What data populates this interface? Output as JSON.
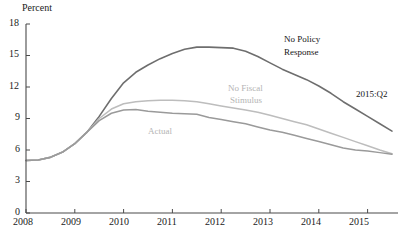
{
  "chart_data": {
    "type": "line",
    "title": "",
    "subtitle": "",
    "xlabel": "",
    "ylabel": "Percent",
    "ylim": [
      0,
      18
    ],
    "xlim": [
      2008,
      2015.5
    ],
    "yticks": [
      "0",
      "3",
      "6",
      "9",
      "12",
      "15",
      "18"
    ],
    "ytick_values": [
      0,
      3,
      6,
      9,
      12,
      15,
      18
    ],
    "xticks": [
      "2008",
      "2009",
      "2010",
      "2011",
      "2012",
      "2013",
      "2014",
      "2015"
    ],
    "xtick_values": [
      2008,
      2009,
      2010,
      2011,
      2012,
      2013,
      2014,
      2015
    ],
    "grid": false,
    "legend_position": "inline-annotations",
    "x": [
      2008.0,
      2008.25,
      2008.5,
      2008.75,
      2009.0,
      2009.25,
      2009.5,
      2009.75,
      2010.0,
      2010.25,
      2010.5,
      2010.75,
      2011.0,
      2011.25,
      2011.5,
      2011.75,
      2012.0,
      2012.25,
      2012.5,
      2012.75,
      2013.0,
      2013.25,
      2013.5,
      2013.75,
      2014.0,
      2014.25,
      2014.5,
      2014.75,
      2015.0,
      2015.25,
      2015.5
    ],
    "series": [
      {
        "name": "No Policy Response",
        "color": "#6e6e6e",
        "values": [
          5.0,
          5.05,
          5.3,
          5.8,
          6.6,
          7.7,
          9.2,
          10.9,
          12.4,
          13.4,
          14.1,
          14.7,
          15.2,
          15.6,
          15.8,
          15.8,
          15.75,
          15.7,
          15.4,
          14.9,
          14.3,
          13.7,
          13.2,
          12.7,
          12.1,
          11.4,
          10.6,
          9.9,
          9.2,
          8.5,
          7.8
        ]
      },
      {
        "name": "No Fiscal Stimulus",
        "color": "#bdbdbd",
        "values": [
          5.0,
          5.05,
          5.3,
          5.8,
          6.6,
          7.7,
          9.0,
          9.9,
          10.4,
          10.6,
          10.7,
          10.75,
          10.75,
          10.7,
          10.6,
          10.4,
          10.2,
          10.0,
          9.8,
          9.6,
          9.3,
          9.0,
          8.7,
          8.4,
          8.0,
          7.6,
          7.2,
          6.8,
          6.4,
          6.0,
          5.65
        ]
      },
      {
        "name": "Actual",
        "color": "#9a9a9a",
        "values": [
          5.0,
          5.05,
          5.3,
          5.8,
          6.6,
          7.7,
          8.8,
          9.5,
          9.8,
          9.85,
          9.7,
          9.6,
          9.5,
          9.45,
          9.4,
          9.1,
          8.9,
          8.7,
          8.5,
          8.2,
          7.9,
          7.7,
          7.4,
          7.1,
          6.8,
          6.5,
          6.2,
          6.0,
          5.9,
          5.75,
          5.6
        ]
      }
    ],
    "annotations": [
      {
        "text": "No Policy Response",
        "x": 2014.0,
        "y": 16.6,
        "color": "#151515"
      },
      {
        "text": "No Fiscal Stimulus",
        "x": 2012.3,
        "y": 11.6,
        "color": "#b0b0b0"
      },
      {
        "text": "Actual",
        "x": 2010.6,
        "y": 7.6,
        "color": "#b0b0b0"
      },
      {
        "text": "2015:Q2",
        "x": 2015.5,
        "y": 10.6,
        "color": "#151515"
      }
    ]
  },
  "labels": {
    "axis_title_y": "Percent",
    "annotation_no_policy_line1": "No Policy",
    "annotation_no_policy_line2": "Response",
    "annotation_no_fiscal_line1": "No Fiscal",
    "annotation_no_fiscal_line2": "Stimulus",
    "annotation_actual": "Actual",
    "annotation_quarter": "2015:Q2",
    "ytick_0": "0",
    "ytick_3": "3",
    "ytick_6": "6",
    "ytick_9": "9",
    "ytick_12": "12",
    "ytick_15": "15",
    "ytick_18": "18",
    "xtick_2008": "2008",
    "xtick_2009": "2009",
    "xtick_2010": "2010",
    "xtick_2011": "2011",
    "xtick_2012": "2012",
    "xtick_2013": "2013",
    "xtick_2014": "2014",
    "xtick_2015": "2015"
  }
}
